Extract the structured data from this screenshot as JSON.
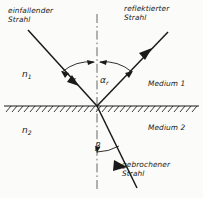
{
  "figure": {
    "background": "#fbfbf9",
    "ink": "#1a1a1a"
  },
  "labels": {
    "incident_ray_line1": "einfallender",
    "incident_ray_line2": "Strahl",
    "reflected_ray_line1": "reflektierter",
    "reflected_ray_line2": "Strahl",
    "refracted_ray_line1": "gebrochener",
    "refracted_ray_line2": "Strahl",
    "index_upper": "n",
    "index_upper_sub": "1",
    "index_lower": "n",
    "index_lower_sub": "2",
    "medium_upper": "Medium 1",
    "medium_lower": "Medium 2",
    "angle_incidence": "α",
    "angle_reflection": "α",
    "angle_reflection_sub": "r",
    "angle_refraction": "β"
  },
  "geometry": {
    "incidence_point": {
      "x": 97,
      "y": 106
    },
    "interface_y": 106,
    "normal_x": 97,
    "normal_top_y": 14,
    "normal_bottom_y": 190,
    "incident_start": {
      "x": 28,
      "y": 30
    },
    "reflected_end": {
      "x": 168,
      "y": 32
    },
    "refracted_end": {
      "x": 137,
      "y": 188
    },
    "angle_incidence_deg": 36,
    "angle_reflection_deg": 36,
    "angle_refraction_deg": 13
  },
  "style": {
    "normal_line": "dash-dot",
    "interface_hatching": "below-line-slanted",
    "ray_arrowheads": "mid-ray"
  }
}
